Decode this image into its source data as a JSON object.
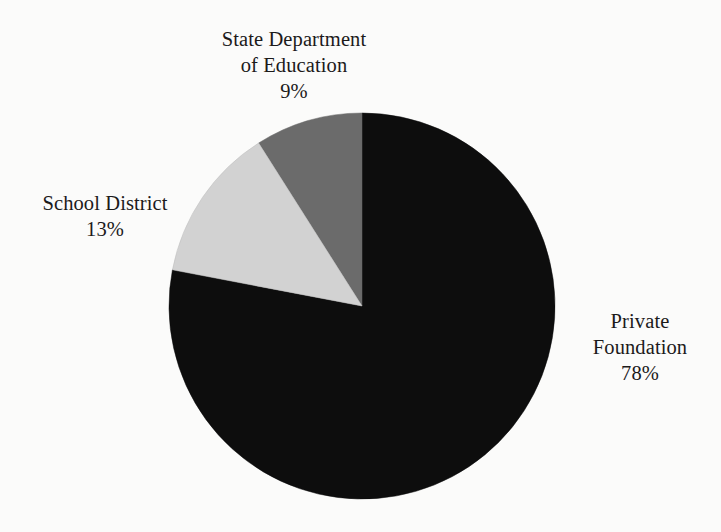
{
  "background_color": "#fbfbfa",
  "text_color": "#1c1a1a",
  "chart_data": {
    "type": "pie",
    "title": "",
    "subtitle": "",
    "xlabel": "",
    "ylabel": "",
    "legend_position": "none",
    "grid": false,
    "labels_outside": true,
    "start_angle_deg": 90,
    "direction": "counterclockwise",
    "categories": [
      "Private Foundation",
      "School District",
      "State Department of Education"
    ],
    "values": [
      78,
      13,
      9
    ],
    "unit": "%",
    "slices": [
      {
        "name": "Private Foundation",
        "label_line1": "Private",
        "label_line2": "Foundation",
        "value": 78,
        "value_text": "78%",
        "color": "#0d0d0d",
        "sweep_deg": 280.8,
        "label_position": "right"
      },
      {
        "name": "School District",
        "label_line1": "School District",
        "label_line2": "",
        "value": 13,
        "value_text": "13%",
        "color": "#d2d2d2",
        "sweep_deg": 46.8,
        "label_position": "left"
      },
      {
        "name": "State Department of Education",
        "label_line1": "State Department",
        "label_line2": "of Education",
        "value": 9,
        "value_text": "9%",
        "color": "#6b6b6b",
        "sweep_deg": 32.4,
        "label_position": "top"
      }
    ],
    "geometry": {
      "center_x": 362,
      "center_y": 306,
      "radius": 193
    }
  }
}
